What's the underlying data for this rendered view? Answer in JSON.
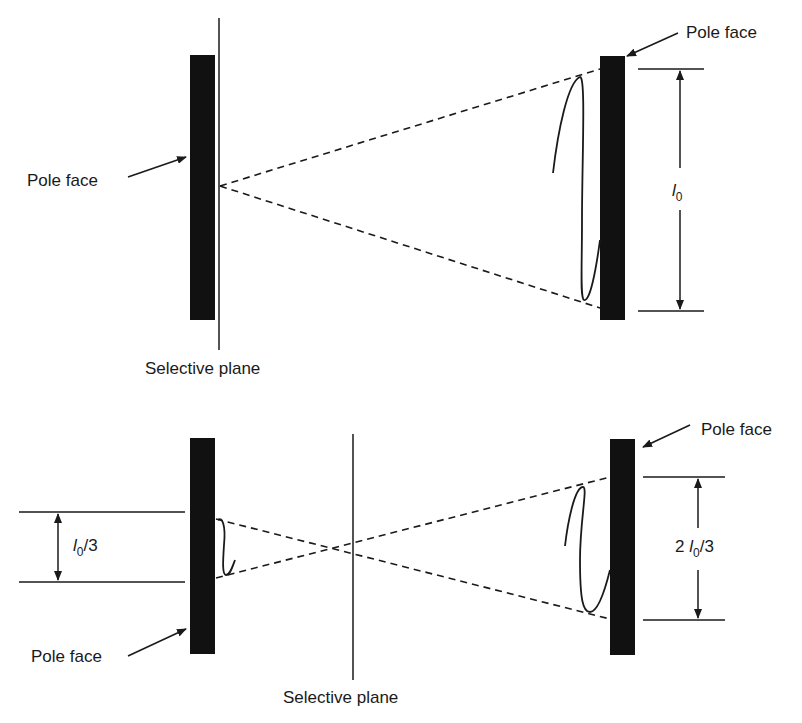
{
  "colors": {
    "ink": "#1a1a1a",
    "pole": "#111111",
    "background": "#ffffff"
  },
  "top_panel": {
    "left_pole_label": "Pole face",
    "right_pole_label": "Pole face",
    "plane_label": "Selective plane",
    "dimension": {
      "symbol": "l",
      "subscript": "0",
      "suffix": "",
      "prefix": ""
    }
  },
  "bottom_panel": {
    "left_pole_label": "Pole face",
    "right_pole_label": "Pole face",
    "plane_label": "Selective plane",
    "left_dimension": {
      "prefix": "",
      "symbol": "l",
      "subscript": "0",
      "suffix": "/3"
    },
    "right_dimension": {
      "prefix": "2 ",
      "symbol": "l",
      "subscript": "0",
      "suffix": "/3"
    }
  }
}
